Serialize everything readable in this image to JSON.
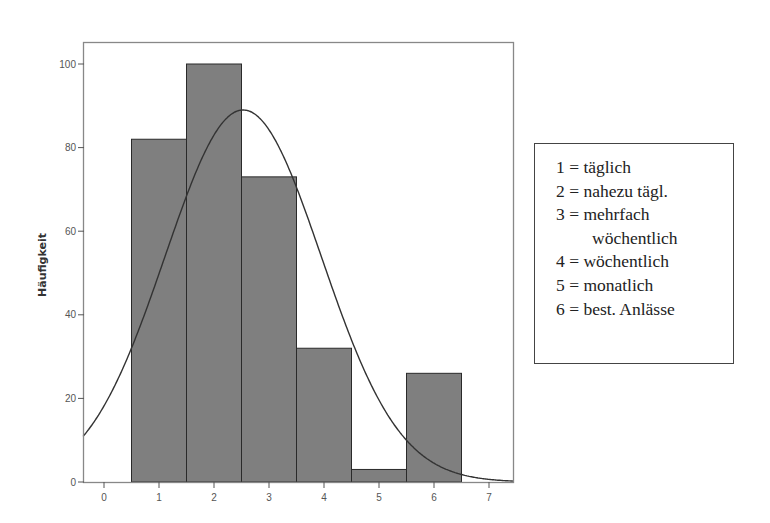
{
  "chart_data": {
    "type": "bar",
    "subtype": "histogram_with_normal_curve",
    "title": "",
    "xlabel": "",
    "ylabel": "Häufigkeit",
    "categories": [
      "1",
      "2",
      "3",
      "4",
      "5",
      "6"
    ],
    "values": [
      82,
      100,
      73,
      32,
      3,
      26
    ],
    "x_ticks": [
      "0",
      "1",
      "2",
      "3",
      "4",
      "5",
      "6",
      "7"
    ],
    "y_ticks": [
      "0",
      "20",
      "40",
      "60",
      "80",
      "100"
    ],
    "xlim": [
      -0.38,
      7.44
    ],
    "ylim": [
      0,
      104
    ],
    "grid": false,
    "normal_curve": {
      "mean": 2.53,
      "sd": 1.42,
      "n": 316,
      "peak": 89
    },
    "bar_color": "#7f7f7f",
    "legend_position": "right",
    "legend": [
      {
        "code": "1 =",
        "label": "täglich"
      },
      {
        "code": "2 =",
        "label": "nahezu tägl."
      },
      {
        "code": "3 =",
        "label": "mehrfach"
      },
      {
        "code": "",
        "label": "wöchentlich"
      },
      {
        "code": "4 =",
        "label": "wöchentlich"
      },
      {
        "code": "5 =",
        "label": "monatlich"
      },
      {
        "code": "6 =",
        "label": "best. Anlässe"
      }
    ]
  }
}
